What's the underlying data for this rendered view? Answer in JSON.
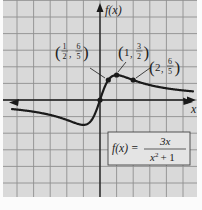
{
  "chart_data": {
    "type": "line",
    "title": "",
    "function": "f(x) = 3x / (x^2 + 1)",
    "xlabel": "x",
    "ylabel": "f(x)",
    "xlim": [
      -6,
      6
    ],
    "ylim": [
      -6,
      6
    ],
    "grid": true,
    "grid_step": 1,
    "legend": null,
    "series": [
      {
        "name": "f(x) = 3x/(x^2+1)",
        "x": [
          -6,
          -5,
          -4,
          -3,
          -2,
          -1,
          -0.5,
          0,
          0.5,
          1,
          2,
          3,
          4,
          5,
          6
        ],
        "y": [
          -0.486,
          -0.577,
          -0.706,
          -0.9,
          -1.2,
          -1.5,
          -1.2,
          0,
          1.2,
          1.5,
          1.2,
          0.9,
          0.706,
          0.577,
          0.486
        ]
      }
    ],
    "annotated_points": [
      {
        "label_num": "1",
        "label_den": "2",
        "label_y_num": "6",
        "label_y_den": "5",
        "x": 0.5,
        "y": 1.2
      },
      {
        "label_x": "1",
        "label_y_num": "3",
        "label_y_den": "2",
        "x": 1,
        "y": 1.5
      },
      {
        "label_x": "2",
        "label_y_num": "6",
        "label_y_den": "5",
        "x": 2,
        "y": 1.2
      },
      {
        "x": 0,
        "y": 0
      }
    ],
    "annotations": [
      "f(x) = 3x / (x^2 + 1)"
    ]
  },
  "labels": {
    "y_axis": "f(x)",
    "x_axis": "x",
    "formula_lhs": "f(x) =",
    "formula_num": "3x",
    "formula_den_base": "x",
    "formula_den_exp": "2",
    "formula_den_rest": "+ 1",
    "p1_xn": "1",
    "p1_xd": "2",
    "p1_yn": "6",
    "p1_yd": "5",
    "p2_x": "1",
    "p2_yn": "3",
    "p2_yd": "2",
    "p3_x": "2",
    "p3_yn": "6",
    "p3_yd": "5"
  },
  "colors": {
    "background": "#d9d9d9",
    "grid": "#8e8e8e",
    "curve": "#1a1a1a",
    "formula_box": "#e4e4e4"
  }
}
